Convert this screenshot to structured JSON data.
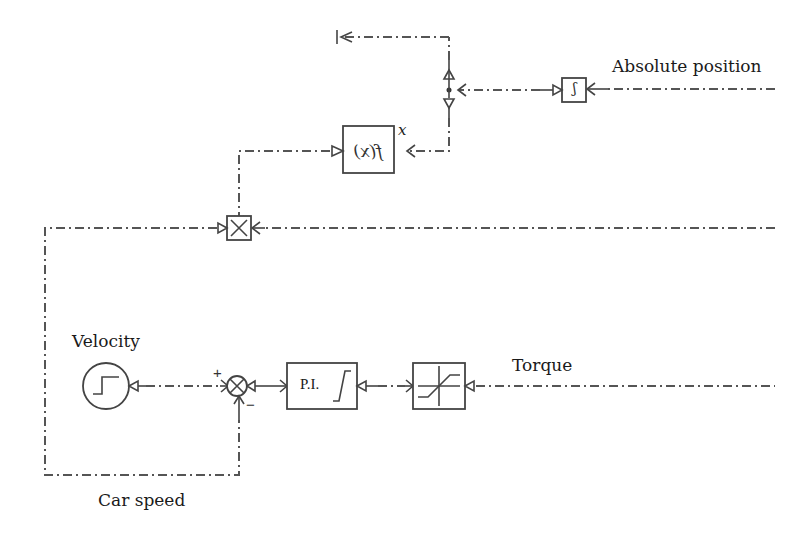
{
  "diagram": {
    "type": "block-diagram",
    "labels": {
      "absolute_position": "Absolute position",
      "velocity": "Velocity",
      "torque": "Torque",
      "car_speed": "Car speed",
      "x_input": "x"
    },
    "blocks": {
      "integrator": {
        "symbol": "∫",
        "note": "mirrored integrator block"
      },
      "function": {
        "text": "f(x)",
        "note": "mirrored function block"
      },
      "multiplier": {
        "symbol": "×"
      },
      "step_source": {
        "symbol": "step"
      },
      "sum": {
        "plus": "+",
        "minus": "−"
      },
      "pi_controller": {
        "text": "P.I."
      },
      "saturation": {
        "symbol": "saturation"
      }
    },
    "colors": {
      "line": "#555555",
      "block": "#444444",
      "text": "#1a1a1a"
    }
  }
}
